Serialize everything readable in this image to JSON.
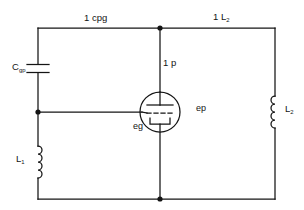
{
  "diagram": {
    "stroke_color": "#141414",
    "background_color": "#ffffff",
    "labels": {
      "top_left_branch": "1 cpg",
      "top_right_branch": "1 L",
      "top_right_branch_sub": "2",
      "plate_branch": "1 p",
      "coupling_capacitor": "C",
      "coupling_capacitor_sub": "gp",
      "plate_voltage": "ep",
      "grid_voltage": "eg",
      "left_inductor": "L",
      "left_inductor_sub": "1",
      "right_inductor": "L",
      "right_inductor_sub": "2"
    },
    "components": [
      {
        "name": "capacitor-cgp",
        "type": "capacitor",
        "position": "left-rail-upper"
      },
      {
        "name": "inductor-l1",
        "type": "inductor",
        "position": "left-rail-lower"
      },
      {
        "name": "inductor-l2",
        "type": "inductor",
        "position": "right-rail"
      },
      {
        "name": "vacuum-tube",
        "type": "triode",
        "position": "center"
      }
    ],
    "junctions": [
      {
        "name": "top-center-junction",
        "x": 160,
        "y": 28
      },
      {
        "name": "left-mid-junction",
        "x": 38,
        "y": 112
      },
      {
        "name": "bottom-center-junction",
        "x": 160,
        "y": 199
      }
    ]
  }
}
